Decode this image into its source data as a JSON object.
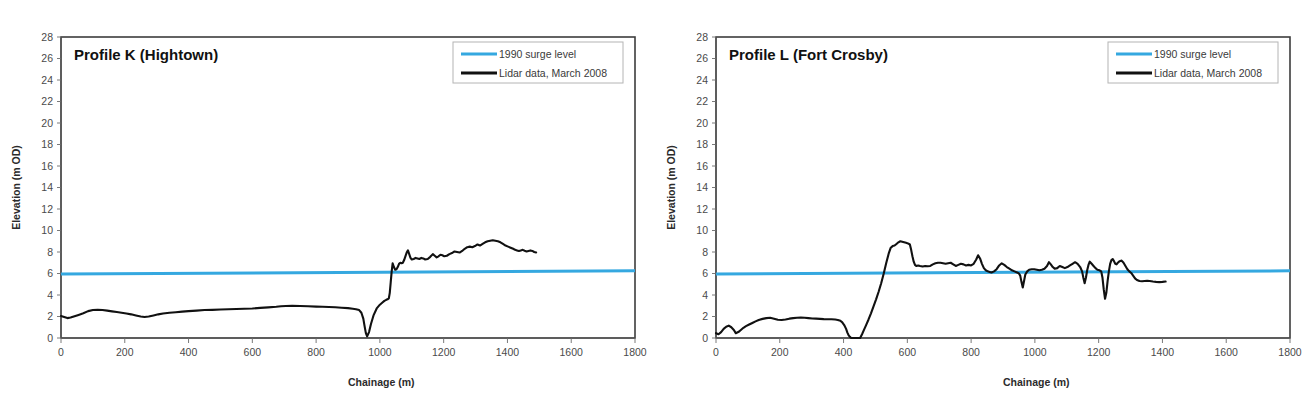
{
  "figure": {
    "panel_count": 2,
    "background_color": "#ffffff"
  },
  "colors": {
    "surge_line": "#35a8e0",
    "lidar_line": "#111111",
    "axis": "#595959",
    "plot_border": "#3d3d3d",
    "legend_border": "#b4b4b4",
    "tick_label": "#4a4a4a",
    "title": "#111111"
  },
  "chart_data": [
    {
      "type": "line",
      "panel": "left",
      "title": "Profile K (Hightown)",
      "xlabel": "Chainage (m)",
      "ylabel": "Elevation (m OD)",
      "xlim": [
        0,
        1800
      ],
      "ylim": [
        0,
        28
      ],
      "xticks": [
        0,
        200,
        400,
        600,
        800,
        1000,
        1200,
        1400,
        1600,
        1800
      ],
      "yticks": [
        0,
        2,
        4,
        6,
        8,
        10,
        12,
        14,
        16,
        18,
        20,
        22,
        24,
        26,
        28
      ],
      "grid": false,
      "legend_position": "top-right",
      "legend": [
        "1990 surge level",
        "Lidar data, March 2008"
      ],
      "series": [
        {
          "name": "1990 surge level",
          "color": "#35a8e0",
          "style": "solid",
          "width": 3,
          "x": [
            0,
            1800
          ],
          "values": [
            5.95,
            6.25
          ]
        },
        {
          "name": "Lidar data, March 2008",
          "color": "#111111",
          "style": "solid",
          "width": 2.1,
          "x": [
            0,
            10,
            20,
            30,
            40,
            55,
            70,
            85,
            100,
            115,
            130,
            145,
            160,
            175,
            190,
            205,
            220,
            235,
            250,
            262,
            275,
            290,
            305,
            320,
            340,
            360,
            380,
            400,
            425,
            450,
            475,
            500,
            525,
            550,
            575,
            600,
            625,
            650,
            675,
            690,
            705,
            725,
            750,
            775,
            800,
            820,
            840,
            860,
            880,
            900,
            915,
            925,
            935,
            942,
            948,
            952,
            956,
            960,
            966,
            972,
            980,
            990,
            1000,
            1008,
            1014,
            1020,
            1024,
            1028,
            1031,
            1034,
            1037,
            1040,
            1044,
            1048,
            1052,
            1056,
            1060,
            1064,
            1068,
            1072,
            1076,
            1080,
            1084,
            1088,
            1092,
            1096,
            1100,
            1106,
            1112,
            1118,
            1124,
            1130,
            1136,
            1142,
            1150,
            1158,
            1166,
            1172,
            1178,
            1184,
            1190,
            1196,
            1202,
            1210,
            1218,
            1226,
            1234,
            1242,
            1250,
            1258,
            1266,
            1274,
            1282,
            1290,
            1298,
            1306,
            1314,
            1322,
            1330,
            1338,
            1346,
            1354,
            1362,
            1370,
            1378,
            1386,
            1394,
            1402,
            1410,
            1418,
            1424,
            1430,
            1436,
            1442,
            1448,
            1454,
            1460,
            1466,
            1472,
            1478,
            1484,
            1490
          ],
          "values": [
            2.05,
            1.95,
            1.85,
            1.9,
            2.0,
            2.15,
            2.3,
            2.5,
            2.6,
            2.62,
            2.6,
            2.55,
            2.48,
            2.42,
            2.35,
            2.28,
            2.2,
            2.1,
            2.0,
            1.95,
            2.0,
            2.1,
            2.2,
            2.28,
            2.35,
            2.4,
            2.45,
            2.5,
            2.55,
            2.6,
            2.62,
            2.65,
            2.68,
            2.7,
            2.72,
            2.75,
            2.8,
            2.85,
            2.9,
            2.95,
            2.98,
            3.0,
            2.98,
            2.95,
            2.92,
            2.9,
            2.88,
            2.86,
            2.82,
            2.78,
            2.72,
            2.68,
            2.6,
            2.35,
            1.8,
            1.1,
            0.45,
            0.15,
            0.55,
            1.3,
            2.1,
            2.75,
            3.1,
            3.3,
            3.45,
            3.55,
            3.6,
            3.68,
            4.2,
            5.2,
            6.2,
            6.95,
            6.6,
            6.35,
            6.4,
            6.6,
            6.9,
            7.0,
            6.95,
            7.0,
            7.25,
            7.6,
            7.95,
            8.15,
            7.8,
            7.45,
            7.3,
            7.35,
            7.45,
            7.4,
            7.35,
            7.45,
            7.4,
            7.3,
            7.35,
            7.55,
            7.8,
            7.65,
            7.5,
            7.6,
            7.75,
            7.7,
            7.6,
            7.65,
            7.8,
            7.9,
            8.05,
            8.0,
            7.95,
            8.1,
            8.3,
            8.45,
            8.5,
            8.45,
            8.55,
            8.7,
            8.6,
            8.75,
            8.9,
            9.0,
            9.05,
            9.1,
            9.05,
            9.0,
            8.9,
            8.75,
            8.6,
            8.5,
            8.4,
            8.3,
            8.2,
            8.15,
            8.1,
            8.15,
            8.2,
            8.12,
            8.05,
            8.1,
            8.15,
            8.1,
            8.0,
            7.95
          ]
        }
      ]
    },
    {
      "type": "line",
      "panel": "right",
      "title": "Profile L (Fort Crosby)",
      "xlabel": "Chainage (m)",
      "ylabel": "Elevation (m OD)",
      "xlim": [
        0,
        1800
      ],
      "ylim": [
        0,
        28
      ],
      "xticks": [
        0,
        200,
        400,
        600,
        800,
        1000,
        1200,
        1400,
        1600,
        1800
      ],
      "yticks": [
        0,
        2,
        4,
        6,
        8,
        10,
        12,
        14,
        16,
        18,
        20,
        22,
        24,
        26,
        28
      ],
      "grid": false,
      "legend_position": "top-right",
      "legend": [
        "1990 surge level",
        "Lidar data, March 2008"
      ],
      "series": [
        {
          "name": "1990 surge level",
          "color": "#35a8e0",
          "style": "solid",
          "width": 3,
          "x": [
            0,
            1800
          ],
          "values": [
            5.95,
            6.25
          ]
        },
        {
          "name": "Lidar data, March 2008",
          "color": "#111111",
          "style": "solid",
          "width": 2.1,
          "x": [
            0,
            8,
            16,
            24,
            32,
            40,
            48,
            56,
            62,
            70,
            78,
            86,
            94,
            104,
            114,
            124,
            134,
            146,
            158,
            170,
            182,
            194,
            206,
            218,
            230,
            242,
            254,
            266,
            278,
            290,
            302,
            314,
            326,
            338,
            350,
            362,
            374,
            382,
            390,
            396,
            402,
            408,
            412,
            416,
            420,
            424,
            452,
            458,
            464,
            470,
            478,
            486,
            494,
            502,
            510,
            518,
            526,
            534,
            542,
            548,
            554,
            560,
            566,
            572,
            578,
            584,
            590,
            596,
            602,
            608,
            612,
            616,
            620,
            624,
            628,
            634,
            640,
            648,
            656,
            664,
            672,
            680,
            688,
            696,
            704,
            712,
            720,
            728,
            736,
            744,
            752,
            760,
            768,
            776,
            784,
            792,
            800,
            808,
            816,
            822,
            828,
            834,
            840,
            846,
            852,
            858,
            864,
            872,
            880,
            888,
            896,
            904,
            912,
            920,
            928,
            936,
            944,
            950,
            954,
            958,
            962,
            966,
            970,
            976,
            982,
            990,
            998,
            1006,
            1014,
            1022,
            1030,
            1038,
            1044,
            1050,
            1056,
            1062,
            1070,
            1078,
            1086,
            1094,
            1102,
            1110,
            1118,
            1126,
            1134,
            1142,
            1148,
            1152,
            1156,
            1160,
            1164,
            1168,
            1172,
            1178,
            1184,
            1190,
            1196,
            1202,
            1208,
            1212,
            1216,
            1220,
            1224,
            1228,
            1232,
            1236,
            1240,
            1244,
            1248,
            1252,
            1256,
            1260,
            1266,
            1272,
            1278,
            1284,
            1290,
            1296,
            1302,
            1308,
            1314,
            1320,
            1328,
            1336,
            1344,
            1352,
            1360,
            1370,
            1380,
            1390,
            1400,
            1410,
            1420,
            1430,
            1440
          ],
          "values": [
            0.45,
            0.35,
            0.55,
            0.85,
            1.05,
            1.15,
            1.0,
            0.75,
            0.45,
            0.55,
            0.75,
            0.95,
            1.1,
            1.25,
            1.4,
            1.55,
            1.68,
            1.78,
            1.85,
            1.88,
            1.8,
            1.7,
            1.68,
            1.72,
            1.8,
            1.85,
            1.88,
            1.9,
            1.88,
            1.85,
            1.82,
            1.8,
            1.78,
            1.76,
            1.75,
            1.74,
            1.72,
            1.68,
            1.6,
            1.45,
            1.2,
            0.85,
            0.5,
            0.25,
            0.1,
            0.0,
            0.0,
            0.35,
            0.75,
            1.15,
            1.7,
            2.3,
            2.95,
            3.6,
            4.3,
            5.1,
            6.0,
            7.0,
            7.9,
            8.4,
            8.55,
            8.6,
            8.75,
            8.9,
            9.0,
            8.95,
            8.9,
            8.85,
            8.8,
            8.7,
            8.2,
            7.6,
            7.1,
            6.8,
            6.7,
            6.75,
            6.7,
            6.65,
            6.7,
            6.68,
            6.7,
            6.85,
            6.95,
            7.0,
            7.0,
            6.95,
            6.9,
            6.95,
            7.0,
            6.85,
            6.7,
            6.8,
            6.9,
            6.85,
            6.75,
            6.8,
            6.75,
            6.9,
            7.3,
            7.7,
            7.4,
            6.9,
            6.5,
            6.3,
            6.2,
            6.15,
            6.1,
            6.2,
            6.4,
            6.75,
            6.95,
            6.8,
            6.6,
            6.45,
            6.3,
            6.2,
            6.1,
            6.0,
            5.8,
            5.2,
            4.7,
            5.3,
            5.9,
            6.2,
            6.35,
            6.4,
            6.4,
            6.35,
            6.3,
            6.35,
            6.45,
            6.7,
            7.05,
            6.85,
            6.6,
            6.45,
            6.5,
            6.7,
            6.6,
            6.5,
            6.6,
            6.75,
            6.9,
            7.05,
            6.9,
            6.6,
            6.2,
            5.6,
            5.1,
            5.6,
            6.3,
            6.8,
            7.1,
            6.9,
            6.7,
            6.5,
            6.35,
            6.3,
            6.2,
            5.6,
            4.5,
            3.65,
            4.2,
            5.3,
            6.2,
            6.9,
            7.25,
            7.35,
            7.15,
            6.9,
            6.85,
            7.0,
            7.15,
            7.2,
            7.0,
            6.7,
            6.4,
            6.2,
            6.05,
            5.8,
            5.55,
            5.4,
            5.3,
            5.28,
            5.3,
            5.32,
            5.3,
            5.25,
            5.22,
            5.2,
            5.22,
            5.25
          ]
        }
      ]
    }
  ]
}
